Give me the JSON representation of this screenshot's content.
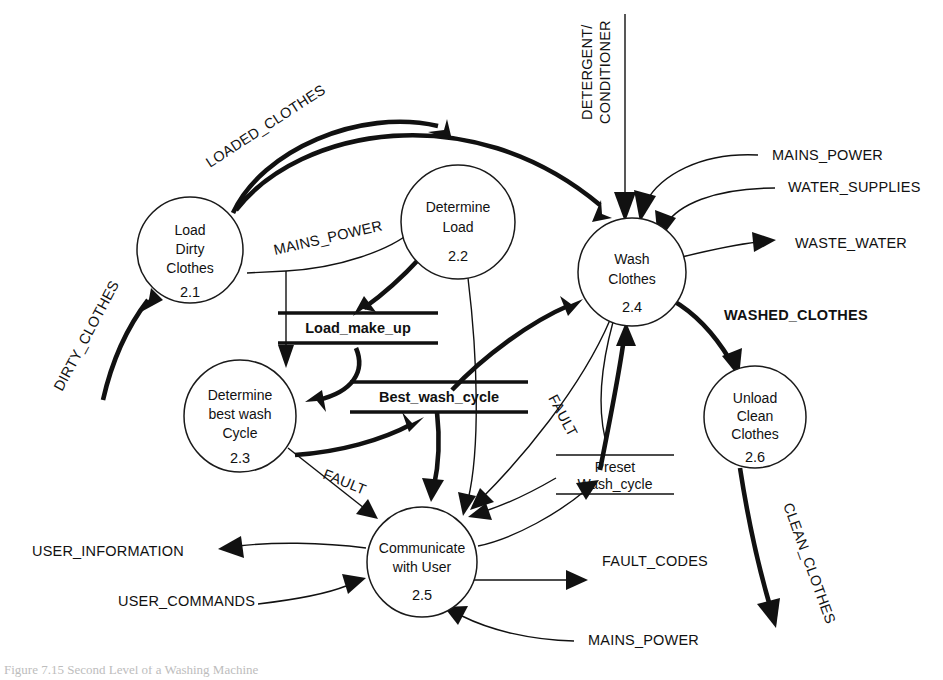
{
  "diagram": {
    "type": "data-flow-diagram",
    "processes": [
      {
        "id": "2.1",
        "lines": [
          "Load",
          "Dirty",
          "Clothes"
        ],
        "number": "2.1",
        "cx": 190,
        "cy": 250,
        "r": 53
      },
      {
        "id": "2.2",
        "lines": [
          "Determine",
          "Load"
        ],
        "number": "2.2",
        "cx": 458,
        "cy": 222,
        "r": 57
      },
      {
        "id": "2.3",
        "lines": [
          "Determine",
          "best wash",
          "Cycle"
        ],
        "number": "2.3",
        "cx": 240,
        "cy": 416,
        "r": 56
      },
      {
        "id": "2.4",
        "lines": [
          "Wash",
          "Clothes"
        ],
        "number": "2.4",
        "cx": 632,
        "cy": 272,
        "r": 54
      },
      {
        "id": "2.5",
        "lines": [
          "Communicate",
          "with User"
        ],
        "number": "2.5",
        "cx": 422,
        "cy": 562,
        "r": 55
      },
      {
        "id": "2.6",
        "lines": [
          "Unload",
          "Clean",
          "Clothes"
        ],
        "number": "2.6",
        "cx": 755,
        "cy": 417,
        "r": 51
      }
    ],
    "data_stores": [
      {
        "id": "load_make_up",
        "label": "Load_make_up",
        "bold": true,
        "x": 278,
        "y": 327,
        "width": 160
      },
      {
        "id": "best_wash_cycle",
        "label": "Best_wash_cycle",
        "bold": true,
        "x": 350,
        "y": 396,
        "width": 178
      },
      {
        "id": "preset_wash_cycle",
        "label_line1": "Preset",
        "label_line2": "Wash_cycle",
        "bold": false,
        "x": 560,
        "y": 455,
        "width": 118
      }
    ],
    "flow_labels": [
      {
        "id": "dirty_clothes",
        "text": "DIRTY_CLOTHES",
        "x": 62,
        "y": 392,
        "rotate": -62,
        "bold": false
      },
      {
        "id": "loaded_clothes",
        "text": "LOADED_CLOTHES",
        "x": 210,
        "y": 168,
        "rotate": -33,
        "bold": false
      },
      {
        "id": "mains_power_load",
        "text": "MAINS_POWER",
        "x": 275,
        "y": 255,
        "rotate": -13,
        "bold": false
      },
      {
        "id": "detergent_conditioner_1",
        "text": "DETERGENT/",
        "x": 592,
        "y": 120,
        "rotate": -90,
        "bold": false
      },
      {
        "id": "detergent_conditioner_2",
        "text": "CONDITIONER",
        "x": 610,
        "y": 124,
        "rotate": -90,
        "bold": false
      },
      {
        "id": "mains_power_wash",
        "text": "MAINS_POWER",
        "x": 772,
        "y": 160,
        "rotate": 0,
        "bold": false
      },
      {
        "id": "water_supplies",
        "text": "WATER_SUPPLIES",
        "x": 788,
        "y": 192,
        "rotate": 0,
        "bold": false
      },
      {
        "id": "waste_water",
        "text": "WASTE_WATER",
        "x": 795,
        "y": 248,
        "rotate": 0,
        "bold": false
      },
      {
        "id": "washed_clothes",
        "text": "WASHED_CLOTHES",
        "x": 724,
        "y": 320,
        "rotate": 0,
        "bold": true
      },
      {
        "id": "clean_clothes",
        "text": "CLEAN_CLOTHES",
        "x": 783,
        "y": 505,
        "rotate": 70,
        "bold": false
      },
      {
        "id": "fault_23",
        "text": "FAULT",
        "x": 322,
        "y": 478,
        "rotate": 22,
        "bold": false
      },
      {
        "id": "fault_wash",
        "text": "FAULT",
        "x": 548,
        "y": 398,
        "rotate": 62,
        "bold": false
      },
      {
        "id": "user_information",
        "text": "USER_INFORMATION",
        "x": 32,
        "y": 556,
        "rotate": 0,
        "bold": false
      },
      {
        "id": "user_commands",
        "text": "USER_COMMANDS",
        "x": 118,
        "y": 606,
        "rotate": 0,
        "bold": false
      },
      {
        "id": "fault_codes",
        "text": "FAULT_CODES",
        "x": 602,
        "y": 566,
        "rotate": 0,
        "bold": false
      },
      {
        "id": "mains_power_user",
        "text": "MAINS_POWER",
        "x": 588,
        "y": 645,
        "rotate": 0,
        "bold": false
      }
    ]
  },
  "caption": {
    "text": "Figure 7.15 Second Level of a Washing Machine"
  }
}
